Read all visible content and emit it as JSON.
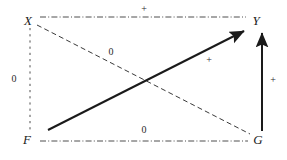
{
  "figure": {
    "type": "path-diagram",
    "width": 287,
    "height": 160,
    "background_color": "#ffffff",
    "stroke_color": "#1a1a1a"
  },
  "nodes": [
    {
      "id": "X",
      "label": "X",
      "x": 28,
      "y": 20
    },
    {
      "id": "Y",
      "label": "Y",
      "x": 256,
      "y": 20
    },
    {
      "id": "F",
      "label": "F",
      "x": 27,
      "y": 139
    },
    {
      "id": "G",
      "label": "G",
      "x": 258,
      "y": 139
    }
  ],
  "edges": [
    {
      "id": "x-y",
      "from": "X",
      "to": "Y",
      "style": "dash-dot",
      "arrow": "none",
      "sign": "+",
      "label_x": 144,
      "label_y": 9
    },
    {
      "id": "x-f",
      "from": "X",
      "to": "F",
      "style": "dotted",
      "arrow": "none",
      "sign": "0",
      "label_x": 14,
      "label_y": 79
    },
    {
      "id": "x-g",
      "from": "X",
      "to": "G",
      "style": "dashed",
      "arrow": "none",
      "sign": "0",
      "label_x": 111,
      "label_y": 52
    },
    {
      "id": "f-y",
      "from": "F",
      "to": "Y",
      "style": "solid",
      "arrow": "to",
      "sign": "+",
      "label_x": 209,
      "label_y": 60
    },
    {
      "id": "g-y",
      "from": "G",
      "to": "Y",
      "style": "solid",
      "arrow": "to",
      "sign": "+",
      "label_x": 273,
      "label_y": 80
    },
    {
      "id": "f-g",
      "from": "F",
      "to": "G",
      "style": "dash-dot",
      "arrow": "none",
      "sign": "0",
      "label_x": 144,
      "label_y": 130
    }
  ]
}
